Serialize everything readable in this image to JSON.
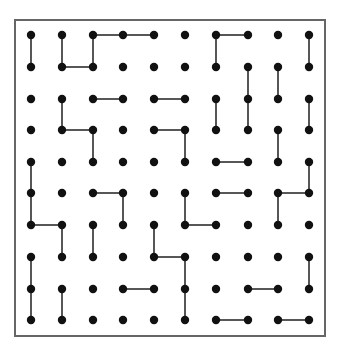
{
  "puzzle": {
    "name": "dot-grid",
    "cols": 10,
    "rows": 10,
    "frame": {
      "x": 15,
      "y": 20,
      "w": 310,
      "h": 316
    },
    "col_x": [
      31,
      62,
      93,
      123,
      154,
      185,
      216,
      248,
      278,
      309
    ],
    "row_y": [
      35,
      67,
      99,
      130,
      162,
      193,
      225,
      257,
      289,
      320
    ],
    "dot_radius": 4.2,
    "colors": {
      "dot": "#111111",
      "line": "#444444",
      "frame": "#666666",
      "background": "#ffffff"
    },
    "edges": [
      [
        [
          2,
          0
        ],
        [
          3,
          0
        ]
      ],
      [
        [
          3,
          0
        ],
        [
          4,
          0
        ]
      ],
      [
        [
          6,
          0
        ],
        [
          7,
          0
        ]
      ],
      [
        [
          0,
          0
        ],
        [
          0,
          1
        ]
      ],
      [
        [
          1,
          0
        ],
        [
          1,
          1
        ]
      ],
      [
        [
          2,
          0
        ],
        [
          2,
          1
        ]
      ],
      [
        [
          6,
          0
        ],
        [
          6,
          1
        ]
      ],
      [
        [
          9,
          0
        ],
        [
          9,
          1
        ]
      ],
      [
        [
          1,
          1
        ],
        [
          2,
          1
        ]
      ],
      [
        [
          7,
          1
        ],
        [
          7,
          2
        ]
      ],
      [
        [
          8,
          1
        ],
        [
          8,
          2
        ]
      ],
      [
        [
          2,
          2
        ],
        [
          3,
          2
        ]
      ],
      [
        [
          4,
          2
        ],
        [
          5,
          2
        ]
      ],
      [
        [
          1,
          2
        ],
        [
          1,
          3
        ]
      ],
      [
        [
          6,
          2
        ],
        [
          6,
          3
        ]
      ],
      [
        [
          7,
          2
        ],
        [
          7,
          3
        ]
      ],
      [
        [
          9,
          2
        ],
        [
          9,
          3
        ]
      ],
      [
        [
          1,
          3
        ],
        [
          2,
          3
        ]
      ],
      [
        [
          4,
          3
        ],
        [
          5,
          3
        ]
      ],
      [
        [
          2,
          3
        ],
        [
          2,
          4
        ]
      ],
      [
        [
          5,
          3
        ],
        [
          5,
          4
        ]
      ],
      [
        [
          8,
          3
        ],
        [
          8,
          4
        ]
      ],
      [
        [
          6,
          4
        ],
        [
          7,
          4
        ]
      ],
      [
        [
          0,
          4
        ],
        [
          0,
          5
        ]
      ],
      [
        [
          9,
          4
        ],
        [
          9,
          5
        ]
      ],
      [
        [
          2,
          5
        ],
        [
          3,
          5
        ]
      ],
      [
        [
          6,
          5
        ],
        [
          7,
          5
        ]
      ],
      [
        [
          8,
          5
        ],
        [
          9,
          5
        ]
      ],
      [
        [
          0,
          5
        ],
        [
          0,
          6
        ]
      ],
      [
        [
          3,
          5
        ],
        [
          3,
          6
        ]
      ],
      [
        [
          5,
          5
        ],
        [
          5,
          6
        ]
      ],
      [
        [
          8,
          5
        ],
        [
          8,
          6
        ]
      ],
      [
        [
          0,
          6
        ],
        [
          1,
          6
        ]
      ],
      [
        [
          5,
          6
        ],
        [
          6,
          6
        ]
      ],
      [
        [
          1,
          6
        ],
        [
          1,
          7
        ]
      ],
      [
        [
          2,
          6
        ],
        [
          2,
          7
        ]
      ],
      [
        [
          4,
          6
        ],
        [
          4,
          7
        ]
      ],
      [
        [
          4,
          7
        ],
        [
          5,
          7
        ]
      ],
      [
        [
          0,
          7
        ],
        [
          0,
          8
        ]
      ],
      [
        [
          5,
          7
        ],
        [
          5,
          8
        ]
      ],
      [
        [
          9,
          7
        ],
        [
          9,
          8
        ]
      ],
      [
        [
          3,
          8
        ],
        [
          4,
          8
        ]
      ],
      [
        [
          7,
          8
        ],
        [
          8,
          8
        ]
      ],
      [
        [
          0,
          8
        ],
        [
          0,
          9
        ]
      ],
      [
        [
          1,
          8
        ],
        [
          1,
          9
        ]
      ],
      [
        [
          5,
          8
        ],
        [
          5,
          9
        ]
      ],
      [
        [
          6,
          9
        ],
        [
          7,
          9
        ]
      ],
      [
        [
          8,
          9
        ],
        [
          9,
          9
        ]
      ]
    ]
  }
}
